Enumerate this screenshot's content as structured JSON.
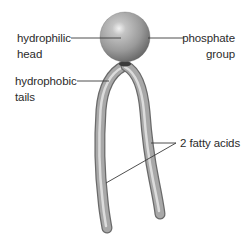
{
  "diagram": {
    "labels": {
      "hydrophilic_head": {
        "line1": "hydrophilic",
        "line2": "head"
      },
      "phosphate_group": {
        "line1": "phosphate",
        "line2": "group"
      },
      "hydrophobic_tails": {
        "line1": "hydrophobic",
        "line2": "tails"
      },
      "fatty_acids": {
        "text": "2 fatty acids"
      }
    },
    "colors": {
      "background": "#ffffff",
      "text": "#2b2b2b",
      "leader_line": "#3a3a3a",
      "sphere_light": "#e8e8e8",
      "sphere_mid": "#9a9a9a",
      "sphere_dark": "#5a5a5a",
      "tail_light": "#d8d8d8",
      "tail_mid": "#a6a6a6",
      "tail_dark": "#6e6e6e"
    }
  }
}
